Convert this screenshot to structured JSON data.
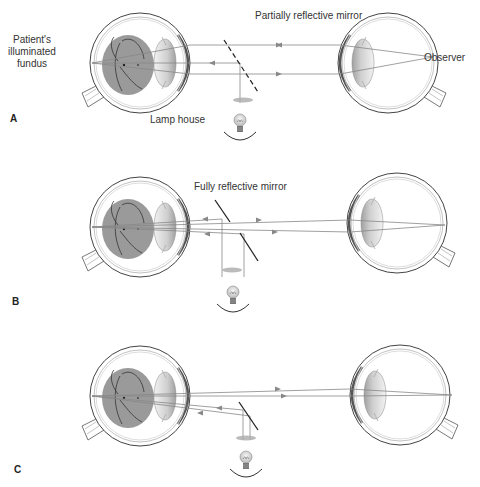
{
  "panels": [
    {
      "letter": "A",
      "mirror_label": "Partially reflective mirror",
      "lamp_label": "Lamp house",
      "patient_label_lines": [
        "Patient's",
        "illuminated",
        "fundus"
      ],
      "observer_label": "Observer"
    },
    {
      "letter": "B",
      "mirror_label": "Fully reflective mirror"
    },
    {
      "letter": "C"
    }
  ],
  "colors": {
    "fundus": "#9a9a9a",
    "outline": "#444444",
    "ray": "#777777",
    "mirror": "#222222",
    "text": "#333333"
  }
}
